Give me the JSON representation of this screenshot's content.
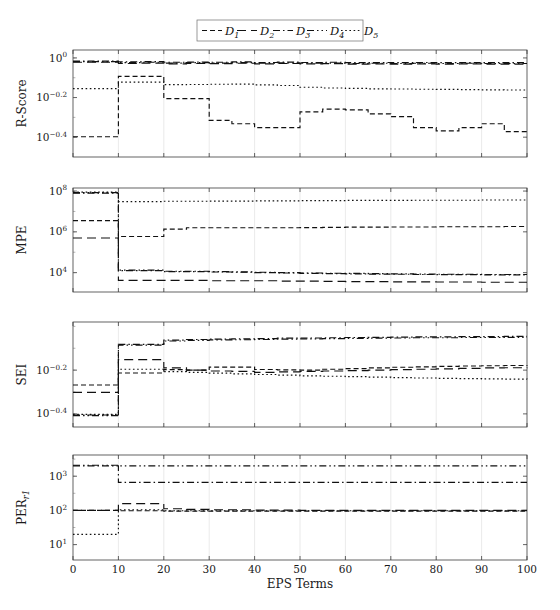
{
  "figure": {
    "xlabel": "EPS Terms",
    "caption": "",
    "legend": {
      "entries": [
        {
          "label": "D",
          "sub": "1",
          "dash": "5,3"
        },
        {
          "label": "D",
          "sub": "2",
          "dash": "9,5"
        },
        {
          "label": "D",
          "sub": "3",
          "dash": "7,3,1.5,3"
        },
        {
          "label": "D",
          "sub": "4",
          "dash": "7,3,1.5,3,1.5,3"
        },
        {
          "label": "D",
          "sub": "5",
          "dash": "1.6,2.6"
        }
      ]
    },
    "xaxis": {
      "min": 0,
      "max": 100,
      "ticks": [
        0,
        10,
        20,
        30,
        40,
        50,
        60,
        70,
        80,
        90,
        100
      ]
    }
  },
  "chart_data": [
    {
      "type": "line",
      "panel": "R-Score",
      "ylabel": "R-Score",
      "xlabel": "EPS Terms",
      "log": true,
      "ylim": [
        -0.5,
        0.04
      ],
      "ytick_exponents": [
        0,
        -0.2,
        -0.4
      ],
      "ytick_labels": [
        "10^{0}",
        "10^{-0.2}",
        "10^{-0.4}"
      ],
      "x": [
        0,
        5,
        10,
        15,
        20,
        25,
        30,
        35,
        40,
        45,
        50,
        55,
        60,
        65,
        70,
        75,
        80,
        85,
        90,
        95,
        100
      ],
      "series": [
        {
          "name": "D_1",
          "values": [
            -0.398,
            -0.398,
            -0.093,
            -0.093,
            -0.205,
            -0.205,
            -0.315,
            -0.332,
            -0.352,
            -0.352,
            -0.272,
            -0.258,
            -0.262,
            -0.282,
            -0.296,
            -0.352,
            -0.368,
            -0.352,
            -0.332,
            -0.372,
            -0.372
          ]
        },
        {
          "name": "D_2",
          "values": [
            -0.022,
            -0.022,
            -0.028,
            -0.026,
            -0.03,
            -0.028,
            -0.029,
            -0.027,
            -0.03,
            -0.028,
            -0.03,
            -0.029,
            -0.031,
            -0.03,
            -0.031,
            -0.03,
            -0.031,
            -0.03,
            -0.031,
            -0.031,
            -0.031
          ]
        },
        {
          "name": "D_3",
          "values": [
            -0.016,
            -0.016,
            -0.02,
            -0.019,
            -0.022,
            -0.021,
            -0.022,
            -0.02,
            -0.023,
            -0.021,
            -0.023,
            -0.022,
            -0.024,
            -0.023,
            -0.024,
            -0.023,
            -0.024,
            -0.023,
            -0.024,
            -0.024,
            -0.024
          ]
        },
        {
          "name": "D_4",
          "values": [
            -0.019,
            -0.019,
            -0.024,
            -0.022,
            -0.026,
            -0.024,
            -0.026,
            -0.024,
            -0.027,
            -0.025,
            -0.027,
            -0.026,
            -0.028,
            -0.027,
            -0.028,
            -0.027,
            -0.028,
            -0.027,
            -0.028,
            -0.028,
            -0.028
          ]
        },
        {
          "name": "D_5",
          "values": [
            -0.155,
            -0.155,
            -0.122,
            -0.122,
            -0.135,
            -0.134,
            -0.133,
            -0.132,
            -0.136,
            -0.139,
            -0.148,
            -0.152,
            -0.154,
            -0.156,
            -0.157,
            -0.158,
            -0.159,
            -0.16,
            -0.161,
            -0.162,
            -0.162
          ]
        }
      ]
    },
    {
      "type": "line",
      "panel": "MPE",
      "ylabel": "MPE",
      "xlabel": "EPS Terms",
      "log": true,
      "ylim": [
        3.05,
        8.15
      ],
      "ytick_exponents": [
        8,
        6,
        4
      ],
      "ytick_labels": [
        "10^{8}",
        "10^{6}",
        "10^{4}"
      ],
      "x": [
        0,
        5,
        10,
        15,
        20,
        25,
        30,
        35,
        40,
        45,
        50,
        55,
        60,
        65,
        70,
        75,
        80,
        85,
        90,
        95,
        100
      ],
      "series": [
        {
          "name": "D_1",
          "values": [
            6.55,
            6.55,
            5.77,
            5.77,
            6.13,
            6.2,
            6.2,
            6.2,
            6.2,
            6.2,
            6.21,
            6.22,
            6.23,
            6.23,
            6.24,
            6.24,
            6.25,
            6.25,
            6.25,
            6.26,
            6.26
          ]
        },
        {
          "name": "D_2",
          "values": [
            5.7,
            5.7,
            3.62,
            3.62,
            3.62,
            3.62,
            3.6,
            3.6,
            3.6,
            3.58,
            3.58,
            3.57,
            3.56,
            3.56,
            3.55,
            3.55,
            3.54,
            3.54,
            3.53,
            3.53,
            3.53
          ]
        },
        {
          "name": "D_3",
          "values": [
            7.9,
            7.9,
            4.1,
            4.1,
            4.05,
            4.05,
            4.03,
            4.02,
            4.0,
            3.98,
            3.96,
            3.95,
            3.94,
            3.93,
            3.92,
            3.91,
            3.9,
            3.9,
            3.89,
            3.89,
            3.89
          ]
        },
        {
          "name": "D_4",
          "values": [
            7.92,
            7.92,
            4.12,
            4.12,
            4.07,
            4.07,
            4.05,
            4.04,
            4.02,
            4.0,
            3.98,
            3.97,
            3.96,
            3.95,
            3.94,
            3.93,
            3.92,
            3.92,
            3.91,
            3.91,
            3.91
          ]
        },
        {
          "name": "D_5",
          "values": [
            7.95,
            7.95,
            7.48,
            7.48,
            7.5,
            7.5,
            7.51,
            7.51,
            7.52,
            7.52,
            7.53,
            7.53,
            7.54,
            7.54,
            7.54,
            7.55,
            7.55,
            7.55,
            7.56,
            7.56,
            7.56
          ]
        }
      ]
    },
    {
      "type": "line",
      "panel": "SEI",
      "ylabel": "SEI",
      "xlabel": "EPS Terms",
      "log": true,
      "ylim": [
        -0.46,
        0.02
      ],
      "ytick_exponents": [
        -0.2,
        -0.4
      ],
      "ytick_labels": [
        "10^{-0.2}",
        "10^{-0.4}"
      ],
      "x": [
        0,
        5,
        10,
        15,
        20,
        25,
        30,
        35,
        40,
        45,
        50,
        55,
        60,
        65,
        70,
        75,
        80,
        85,
        90,
        95,
        100
      ],
      "series": [
        {
          "name": "D_1",
          "values": [
            -0.268,
            -0.268,
            -0.213,
            -0.213,
            -0.198,
            -0.2,
            -0.186,
            -0.186,
            -0.197,
            -0.199,
            -0.2,
            -0.196,
            -0.193,
            -0.19,
            -0.187,
            -0.185,
            -0.183,
            -0.181,
            -0.18,
            -0.179,
            -0.178
          ]
        },
        {
          "name": "D_2",
          "values": [
            -0.302,
            -0.302,
            -0.152,
            -0.152,
            -0.19,
            -0.2,
            -0.204,
            -0.206,
            -0.21,
            -0.208,
            -0.206,
            -0.204,
            -0.202,
            -0.2,
            -0.198,
            -0.196,
            -0.194,
            -0.192,
            -0.19,
            -0.189,
            -0.188
          ]
        },
        {
          "name": "D_3",
          "values": [
            -0.405,
            -0.405,
            -0.082,
            -0.082,
            -0.063,
            -0.06,
            -0.058,
            -0.057,
            -0.056,
            -0.054,
            -0.053,
            -0.052,
            -0.051,
            -0.05,
            -0.049,
            -0.048,
            -0.048,
            -0.047,
            -0.047,
            -0.046,
            -0.046
          ]
        },
        {
          "name": "D_4",
          "values": [
            -0.408,
            -0.408,
            -0.086,
            -0.086,
            -0.067,
            -0.064,
            -0.062,
            -0.061,
            -0.06,
            -0.058,
            -0.057,
            -0.056,
            -0.055,
            -0.054,
            -0.053,
            -0.052,
            -0.052,
            -0.051,
            -0.051,
            -0.05,
            -0.05
          ]
        },
        {
          "name": "D_5",
          "values": [
            -0.402,
            -0.402,
            -0.196,
            -0.196,
            -0.207,
            -0.21,
            -0.214,
            -0.217,
            -0.22,
            -0.223,
            -0.226,
            -0.228,
            -0.23,
            -0.232,
            -0.234,
            -0.236,
            -0.238,
            -0.239,
            -0.24,
            -0.241,
            -0.242
          ]
        }
      ]
    },
    {
      "type": "line",
      "panel": "PER",
      "ylabel": "PER",
      "ylabel_sub": "r1",
      "xlabel": "EPS Terms",
      "log": true,
      "ylim": [
        0.55,
        3.62
      ],
      "ytick_exponents": [
        3,
        2,
        1
      ],
      "ytick_labels": [
        "10^{3}",
        "10^{2}",
        "10^{1}"
      ],
      "x": [
        0,
        5,
        10,
        15,
        20,
        25,
        30,
        35,
        40,
        45,
        50,
        55,
        60,
        65,
        70,
        75,
        80,
        85,
        90,
        95,
        100
      ],
      "series": [
        {
          "name": "D_1",
          "values": [
            2.0,
            2.0,
            1.99,
            1.99,
            1.98,
            1.98,
            1.98,
            1.98,
            1.98,
            1.98,
            1.98,
            1.98,
            1.98,
            1.98,
            1.98,
            1.98,
            1.98,
            1.98,
            1.98,
            1.98,
            1.98
          ]
        },
        {
          "name": "D_2",
          "values": [
            2.0,
            2.0,
            2.2,
            2.2,
            2.05,
            2.03,
            2.02,
            2.02,
            2.01,
            2.01,
            2.0,
            2.0,
            2.0,
            2.0,
            2.0,
            2.0,
            2.0,
            2.0,
            2.0,
            2.0,
            2.0
          ]
        },
        {
          "name": "D_3",
          "values": [
            3.3,
            3.3,
            2.82,
            2.82,
            2.82,
            2.82,
            2.82,
            2.82,
            2.82,
            2.82,
            2.82,
            2.82,
            2.82,
            2.82,
            2.82,
            2.82,
            2.82,
            2.82,
            2.82,
            2.82,
            2.82
          ]
        },
        {
          "name": "D_4",
          "values": [
            3.32,
            3.32,
            3.3,
            3.3,
            3.3,
            3.3,
            3.3,
            3.3,
            3.3,
            3.3,
            3.3,
            3.3,
            3.3,
            3.3,
            3.3,
            3.3,
            3.3,
            3.3,
            3.3,
            3.3,
            3.3
          ]
        },
        {
          "name": "D_5",
          "values": [
            1.3,
            1.3,
            2.02,
            2.02,
            1.99,
            1.99,
            1.99,
            1.99,
            1.99,
            1.99,
            1.99,
            1.99,
            1.99,
            1.99,
            1.99,
            1.99,
            1.99,
            1.99,
            1.99,
            1.99,
            1.99
          ]
        }
      ]
    }
  ]
}
